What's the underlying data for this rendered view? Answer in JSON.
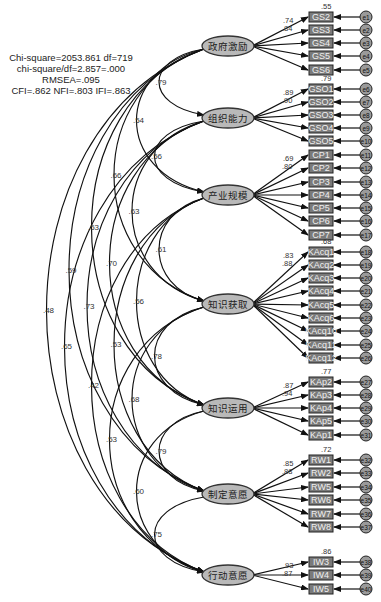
{
  "fit_stats": {
    "line1": "Chi-square=2053.861  df=719",
    "line2": "chi-square/df=2.857=.000",
    "line3": "RMSEA=.095",
    "line4": "CFI=.862 NFI=.803 IFI=.863"
  },
  "colors": {
    "latent_fill": "#b9b9b9",
    "indicator_fill": "#7a7a7a",
    "error_fill": "#9a9a9a",
    "line": "#111111"
  },
  "latents": [
    {
      "id": "L1",
      "label": "政府激励",
      "cx": 228,
      "cy": 46,
      "top_r2": ".55",
      "loadings_shown": [
        ".74",
        ".84"
      ],
      "indicators": [
        {
          "label": "GS2",
          "error": "e1",
          "y": 17
        },
        {
          "label": "GS3",
          "error": "e2",
          "y": 30
        },
        {
          "label": "GS4",
          "error": "e3",
          "y": 43
        },
        {
          "label": "GS5",
          "error": "e4",
          "y": 56
        },
        {
          "label": "GS6",
          "error": "e5",
          "y": 70
        }
      ]
    },
    {
      "id": "L2",
      "label": "组织能力",
      "cx": 228,
      "cy": 118,
      "top_r2": ".79",
      "loadings_shown": [
        ".89",
        ".90"
      ],
      "indicators": [
        {
          "label": "GSO1",
          "error": "e6",
          "y": 89
        },
        {
          "label": "GSO2",
          "error": "e7",
          "y": 102
        },
        {
          "label": "GSO3",
          "error": "e8",
          "y": 115
        },
        {
          "label": "GSO4",
          "error": "e9",
          "y": 128
        },
        {
          "label": "GSO5",
          "error": "e10",
          "y": 141
        }
      ]
    },
    {
      "id": "L3",
      "label": "产业规模",
      "cx": 228,
      "cy": 195,
      "top_r2": "",
      "loadings_shown": [
        ".69",
        ".80"
      ],
      "indicators": [
        {
          "label": "CP1",
          "error": "e11",
          "y": 155
        },
        {
          "label": "CP2",
          "error": "e12",
          "y": 168
        },
        {
          "label": "CP3",
          "error": "e13",
          "y": 182
        },
        {
          "label": "CP4",
          "error": "e14",
          "y": 195
        },
        {
          "label": "CP5",
          "error": "e15",
          "y": 208
        },
        {
          "label": "CP6",
          "error": "e16",
          "y": 221
        },
        {
          "label": "CP7",
          "error": "e17",
          "y": 235
        }
      ]
    },
    {
      "id": "L4",
      "label": "知识获取",
      "cx": 228,
      "cy": 304,
      "top_r2": ".68",
      "loadings_shown": [
        ".83",
        ".88"
      ],
      "indicators": [
        {
          "label": "KAcq1",
          "error": "e18",
          "y": 252
        },
        {
          "label": "KAcq2",
          "error": "e19",
          "y": 265
        },
        {
          "label": "KAcq3",
          "error": "e20",
          "y": 278
        },
        {
          "label": "KAcq4",
          "error": "e21",
          "y": 291
        },
        {
          "label": "KAcq5",
          "error": "e22",
          "y": 305
        },
        {
          "label": "KAcq6",
          "error": "e23",
          "y": 318
        },
        {
          "label": "KAcq10",
          "error": "e24",
          "y": 331
        },
        {
          "label": "KAcq11",
          "error": "e25",
          "y": 345
        },
        {
          "label": "KAcq12",
          "error": "e26",
          "y": 358
        }
      ]
    },
    {
      "id": "L5",
      "label": "知识运用",
      "cx": 228,
      "cy": 408,
      "top_r2": ".77",
      "loadings_shown": [
        ".87",
        ".94"
      ],
      "indicators": [
        {
          "label": "KAp2",
          "error": "e27",
          "y": 382
        },
        {
          "label": "KAp3",
          "error": "e28",
          "y": 395
        },
        {
          "label": "KAp4",
          "error": "e29",
          "y": 408
        },
        {
          "label": "KAp5",
          "error": "e30",
          "y": 421
        },
        {
          "label": "KAp1",
          "error": "e31",
          "y": 435
        }
      ]
    },
    {
      "id": "L6",
      "label": "制定意愿",
      "cx": 228,
      "cy": 494,
      "top_r2": ".72",
      "loadings_shown": [
        ".85",
        ".88"
      ],
      "indicators": [
        {
          "label": "RW1",
          "error": "e32",
          "y": 460
        },
        {
          "label": "RW2",
          "error": "e33",
          "y": 473
        },
        {
          "label": "RW5",
          "error": "e34",
          "y": 487
        },
        {
          "label": "RW6",
          "error": "e35",
          "y": 500
        },
        {
          "label": "RW7",
          "error": "e36",
          "y": 514
        },
        {
          "label": "RW8",
          "error": "e37",
          "y": 527
        }
      ]
    },
    {
      "id": "L7",
      "label": "行动意愿",
      "cx": 228,
      "cy": 575,
      "top_r2": ".86",
      "loadings_shown": [
        ".93",
        ".87"
      ],
      "indicators": [
        {
          "label": "IW3",
          "error": "e38",
          "y": 562
        },
        {
          "label": "IW4",
          "error": "e39",
          "y": 575
        },
        {
          "label": "IW5",
          "error": "e40",
          "y": 589
        }
      ]
    }
  ],
  "correlations": [
    {
      "from": "L1",
      "to": "L2",
      "value": ".79"
    },
    {
      "from": "L1",
      "to": "L3",
      "value": ".54"
    },
    {
      "from": "L1",
      "to": "L4",
      "value": ".66"
    },
    {
      "from": "L1",
      "to": "L5",
      "value": ".53"
    },
    {
      "from": "L1",
      "to": "L6",
      "value": ".59"
    },
    {
      "from": "L1",
      "to": "L7",
      "value": ".48"
    },
    {
      "from": "L2",
      "to": "L3",
      "value": ".56"
    },
    {
      "from": "L2",
      "to": "L4",
      "value": ".63"
    },
    {
      "from": "L2",
      "to": "L5",
      "value": ".70"
    },
    {
      "from": "L2",
      "to": "L6",
      "value": ".73"
    },
    {
      "from": "L2",
      "to": "L7",
      "value": ".65"
    },
    {
      "from": "L3",
      "to": "L4",
      "value": ".61"
    },
    {
      "from": "L3",
      "to": "L5",
      "value": ".56"
    },
    {
      "from": "L3",
      "to": "L6",
      "value": ".53"
    },
    {
      "from": "L3",
      "to": "L7",
      "value": ".42"
    },
    {
      "from": "L4",
      "to": "L5",
      "value": ".78"
    },
    {
      "from": "L4",
      "to": "L6",
      "value": ".68"
    },
    {
      "from": "L4",
      "to": "L7",
      "value": ".53"
    },
    {
      "from": "L5",
      "to": "L6",
      "value": ".79"
    },
    {
      "from": "L5",
      "to": "L7",
      "value": ".60"
    },
    {
      "from": "L6",
      "to": "L7",
      "value": ".75"
    }
  ]
}
